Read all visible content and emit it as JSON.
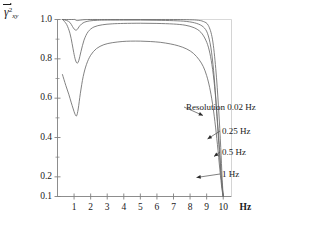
{
  "chart_data": {
    "type": "line",
    "title": "",
    "subtitle": "",
    "xlabel": "",
    "ylabel": "γ̅²xy",
    "ylabel_symbol": "γ",
    "ylabel_subscript": "xy",
    "ylabel_superscript": "2",
    "x_unit": "Hz",
    "xlim": [
      0,
      10.5
    ],
    "ylim": [
      0.1,
      1.0
    ],
    "grid": false,
    "legend_position": "inline-annotations",
    "xticks": [
      1,
      2,
      3,
      4,
      5,
      6,
      7,
      8,
      9,
      10
    ],
    "xtick_labels": [
      "1",
      "2",
      "3",
      "4",
      "5",
      "6",
      "7",
      "8",
      "9",
      "10"
    ],
    "yticks": [
      0.1,
      0.2,
      0.4,
      0.6,
      0.8,
      1.0
    ],
    "ytick_labels": [
      "0.1",
      "0.2",
      "0.4",
      "0.6",
      "0.8",
      "1.0"
    ],
    "ytick_minor": [
      0.3,
      0.5,
      0.7,
      0.9
    ],
    "series": [
      {
        "name": "Resolution 0.02 Hz",
        "annotation": "Resolution 0.02 Hz",
        "color": "#6b6b6b",
        "x": [
          0.3,
          0.55,
          0.75,
          0.95,
          1.05,
          1.15,
          1.25,
          1.4,
          1.6,
          1.9,
          2.4,
          3.0,
          4.0,
          5.0,
          6.0,
          7.0,
          7.8,
          8.4,
          8.8,
          9.1,
          9.35,
          9.55,
          9.72,
          9.85,
          9.93,
          10.0
        ],
        "y": [
          1.0,
          1.0,
          1.0,
          1.0,
          1.0,
          0.995,
          0.995,
          0.997,
          0.999,
          1.0,
          1.0,
          1.0,
          1.0,
          1.0,
          1.0,
          1.0,
          0.999,
          0.997,
          0.99,
          0.97,
          0.9,
          0.75,
          0.55,
          0.35,
          0.2,
          0.1
        ]
      },
      {
        "name": "0.25 Hz",
        "annotation": "0.25 Hz",
        "color": "#6b6b6b",
        "x": [
          0.3,
          0.55,
          0.75,
          0.9,
          1.0,
          1.1,
          1.2,
          1.3,
          1.45,
          1.65,
          1.95,
          2.4,
          3.0,
          4.0,
          5.0,
          6.0,
          7.0,
          7.8,
          8.4,
          8.8,
          9.05,
          9.25,
          9.42,
          9.55,
          9.7,
          9.85,
          10.0
        ],
        "y": [
          1.0,
          0.995,
          0.985,
          0.965,
          0.952,
          0.946,
          0.95,
          0.963,
          0.977,
          0.987,
          0.993,
          0.996,
          0.997,
          0.997,
          0.997,
          0.996,
          0.994,
          0.99,
          0.98,
          0.962,
          0.93,
          0.86,
          0.74,
          0.6,
          0.41,
          0.23,
          0.1
        ]
      },
      {
        "name": "0.5 Hz",
        "annotation": "0.5 Hz",
        "color": "#6b6b6b",
        "x": [
          0.3,
          0.55,
          0.75,
          0.88,
          0.98,
          1.08,
          1.18,
          1.28,
          1.42,
          1.6,
          1.85,
          2.2,
          2.7,
          3.3,
          4.0,
          5.0,
          6.0,
          7.0,
          7.7,
          8.25,
          8.65,
          8.95,
          9.15,
          9.32,
          9.48,
          9.62,
          9.78,
          9.9,
          10.0
        ],
        "y": [
          1.0,
          0.975,
          0.93,
          0.878,
          0.832,
          0.795,
          0.778,
          0.79,
          0.838,
          0.895,
          0.938,
          0.962,
          0.973,
          0.978,
          0.98,
          0.981,
          0.98,
          0.977,
          0.971,
          0.958,
          0.935,
          0.895,
          0.845,
          0.77,
          0.66,
          0.52,
          0.34,
          0.18,
          0.1
        ]
      },
      {
        "name": "1 Hz",
        "annotation": "1 Hz",
        "color": "#6b6b6b",
        "x": [
          0.3,
          0.5,
          0.68,
          0.82,
          0.95,
          1.05,
          1.15,
          1.25,
          1.38,
          1.55,
          1.75,
          2.0,
          2.35,
          2.8,
          3.3,
          3.9,
          4.4,
          5.0,
          5.6,
          6.2,
          6.8,
          7.3,
          7.8,
          8.2,
          8.55,
          8.8,
          9.0,
          9.18,
          9.35,
          9.5,
          9.65,
          9.8,
          9.92,
          10.0
        ],
        "y": [
          0.72,
          0.665,
          0.62,
          0.58,
          0.545,
          0.52,
          0.51,
          0.545,
          0.625,
          0.71,
          0.772,
          0.818,
          0.852,
          0.872,
          0.882,
          0.888,
          0.89,
          0.89,
          0.888,
          0.884,
          0.876,
          0.866,
          0.85,
          0.828,
          0.795,
          0.76,
          0.715,
          0.655,
          0.575,
          0.48,
          0.365,
          0.235,
          0.14,
          0.1
        ]
      }
    ],
    "annotations": [
      {
        "label": "Resolution 0.02 Hz",
        "target_series": "Resolution 0.02 Hz"
      },
      {
        "label": "0.25 Hz",
        "target_series": "0.25 Hz"
      },
      {
        "label": "0.5 Hz",
        "target_series": "0.5 Hz"
      },
      {
        "label": "1 Hz",
        "target_series": "1 Hz"
      }
    ],
    "colors": {
      "curve": "#6b6b6b",
      "axis": "#808080",
      "text": "#1a1a1a",
      "background": "#ffffff"
    }
  }
}
